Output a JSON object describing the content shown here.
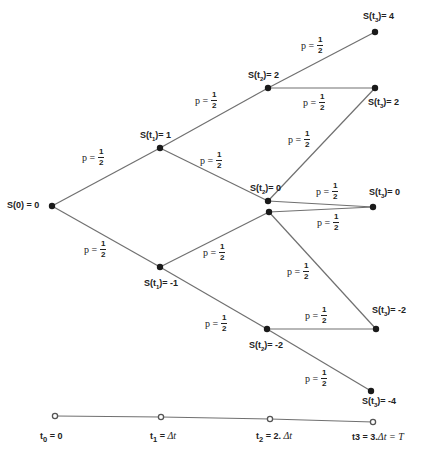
{
  "nodes": [
    {
      "id": "s0",
      "label": "S(0) = 0",
      "x": 52,
      "y": 206
    },
    {
      "id": "s1_up",
      "label_prefix": "S(t",
      "sub": "1",
      "label_suffix": ")= 1",
      "x": 160,
      "y": 148
    },
    {
      "id": "s1_down",
      "label_prefix": "S(t",
      "sub": "1",
      "label_suffix": ")= -1",
      "x": 160,
      "y": 267
    },
    {
      "id": "s2_2",
      "label_prefix": "S(t",
      "sub": "2",
      "label_suffix": ")= 2",
      "x": 268,
      "y": 88
    },
    {
      "id": "s2_0a",
      "label_prefix": "S(t",
      "sub": "2",
      "label_suffix": ")= 0",
      "x": 268,
      "y": 201
    },
    {
      "id": "s2_0b",
      "x": 269,
      "y": 212
    },
    {
      "id": "s2_m2",
      "label_prefix": "S(t",
      "sub": "2",
      "label_suffix": ")= -2",
      "x": 267,
      "y": 329
    },
    {
      "id": "s3_4",
      "label_prefix": "S(t",
      "sub": "3",
      "label_suffix": ")= 4",
      "x": 375,
      "y": 32
    },
    {
      "id": "s3_2",
      "label_prefix": "S(t",
      "sub": "3",
      "label_suffix": ")= 2",
      "x": 375,
      "y": 88
    },
    {
      "id": "s3_0",
      "label_prefix": "S(t",
      "sub": "3",
      "label_suffix": ")= 0",
      "x": 373,
      "y": 207
    },
    {
      "id": "s3_m2",
      "label_prefix": "S(t",
      "sub": "3",
      "label_suffix": ")= -2",
      "x": 376,
      "y": 329
    },
    {
      "id": "s3_m4",
      "label_prefix": "S(t",
      "sub": "3",
      "label_suffix": ")= -4",
      "x": 371,
      "y": 391
    }
  ],
  "edges": [
    [
      "s0",
      "s1_up"
    ],
    [
      "s0",
      "s1_down"
    ],
    [
      "s1_up",
      "s2_2"
    ],
    [
      "s1_up",
      "s2_0a"
    ],
    [
      "s1_down",
      "s2_0b"
    ],
    [
      "s1_down",
      "s2_m2"
    ],
    [
      "s2_2",
      "s3_4"
    ],
    [
      "s2_2",
      "s3_2"
    ],
    [
      "s2_0a",
      "s3_2"
    ],
    [
      "s2_0a",
      "s3_0"
    ],
    [
      "s2_0b",
      "s3_0"
    ],
    [
      "s2_0b",
      "s3_m2"
    ],
    [
      "s2_m2",
      "s3_m2"
    ],
    [
      "s2_m2",
      "s3_m4"
    ]
  ],
  "probability": {
    "prefix": "p =",
    "numerator": "1",
    "denominator": "2"
  },
  "timeline": {
    "points": [
      {
        "x": 55,
        "y": 416,
        "label_prefix": "t",
        "sub": "0",
        "label_suffix": " = 0",
        "italic": ""
      },
      {
        "x": 161,
        "y": 417,
        "label_prefix": "t",
        "sub": "1",
        "label_suffix": " = ",
        "italic": "Δt"
      },
      {
        "x": 270,
        "y": 419,
        "label_prefix": "t",
        "sub": "2",
        "label_suffix": " = 2. ",
        "italic": "Δt"
      },
      {
        "x": 373,
        "y": 422,
        "label_prefix": "t3 = 3.",
        "sub": "",
        "label_suffix": "",
        "italic": "Δt =  T"
      }
    ]
  },
  "colors": {
    "line": "#707070",
    "node": "#1a1a1a",
    "text": "#222222"
  }
}
